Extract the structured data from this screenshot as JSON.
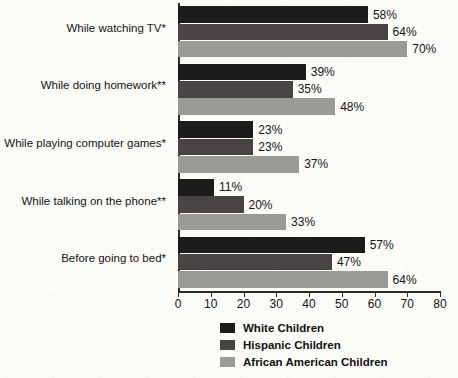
{
  "chart_data": {
    "type": "bar",
    "orientation": "horizontal",
    "title": "",
    "xlabel": "",
    "ylabel": "",
    "xlim": [
      0,
      80
    ],
    "xticks": [
      0,
      10,
      20,
      30,
      40,
      50,
      60,
      70,
      80
    ],
    "xtick_labels": [
      "0",
      "10",
      "20",
      "30",
      "40",
      "50",
      "60",
      "70",
      "80"
    ],
    "grid": false,
    "value_suffix": "%",
    "legend_position": "bottom-center",
    "categories": [
      "While watching TV*",
      "While doing homework**",
      "While playing computer games*",
      "While talking on the phone**",
      "Before going to bed*"
    ],
    "series": [
      {
        "name": "White Children",
        "color": "#1e1c1a",
        "values": [
          58,
          39,
          23,
          11,
          57
        ],
        "labels": [
          "58%",
          "39%",
          "23%",
          "11%",
          "57%"
        ]
      },
      {
        "name": "Hispanic Children",
        "color": "#474443",
        "values": [
          64,
          35,
          23,
          20,
          47
        ],
        "labels": [
          "64%",
          "35%",
          "23%",
          "20%",
          "47%"
        ]
      },
      {
        "name": "African American Children",
        "color": "#9b9a97",
        "values": [
          70,
          48,
          37,
          33,
          64
        ],
        "labels": [
          "70%",
          "48%",
          "37%",
          "33%",
          "64%"
        ]
      }
    ]
  },
  "legend": {
    "items": [
      {
        "label": "White Children",
        "color": "#1e1c1a"
      },
      {
        "label": "Hispanic Children",
        "color": "#474443"
      },
      {
        "label": "African American Children",
        "color": "#9b9a97"
      }
    ]
  }
}
